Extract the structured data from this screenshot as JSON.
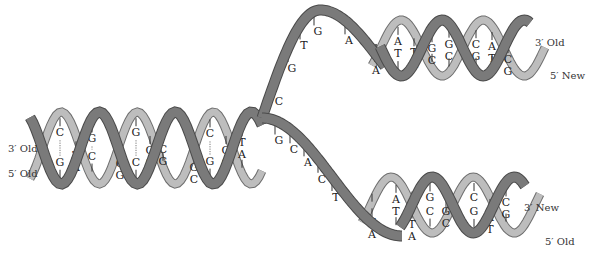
{
  "labels": {
    "left_top": "3′ Old",
    "left_bottom": "5′ Old",
    "upper_right_top": "3′ Old",
    "upper_right_bottom": "5′ New",
    "lower_right_top": "3′ New",
    "lower_right_bottom": "5′ Old"
  },
  "parent_helix": {
    "pairs": [
      {
        "top": "C",
        "bottom": "G"
      },
      {
        "top": "T",
        "bottom": "A"
      },
      {
        "top": "G",
        "bottom": "C"
      },
      {
        "top": "C",
        "bottom": "G"
      },
      {
        "top": "G",
        "bottom": "C"
      },
      {
        "top": "G",
        "bottom": "C"
      },
      {
        "top": "C",
        "bottom": "G"
      },
      {
        "top": "G",
        "bottom": "C"
      },
      {
        "top": "C",
        "bottom": "G"
      },
      {
        "top": "G",
        "bottom": "C"
      },
      {
        "top": "T",
        "bottom": "A"
      }
    ]
  },
  "upper_single_strand": [
    "C",
    "G",
    "T",
    "G",
    "A"
  ],
  "lower_single_strand": [
    "G",
    "C",
    "A",
    "C",
    "T"
  ],
  "upper_daughter": {
    "pairs": [
      {
        "top": "T",
        "bottom": "A"
      },
      {
        "top": "A",
        "bottom": "T"
      },
      {
        "top": "T",
        "bottom": "A"
      },
      {
        "top": "G",
        "bottom": "C"
      },
      {
        "top": "G",
        "bottom": "C"
      },
      {
        "top": "C",
        "bottom": "G"
      },
      {
        "top": "A",
        "bottom": "T"
      },
      {
        "top": "C",
        "bottom": "G"
      }
    ]
  },
  "lower_daughter": {
    "pairs": [
      {
        "top": "T",
        "bottom": "A"
      },
      {
        "top": "A",
        "bottom": "T"
      },
      {
        "top": "T",
        "bottom": "A"
      },
      {
        "top": "G",
        "bottom": "C"
      },
      {
        "top": "G",
        "bottom": "C"
      },
      {
        "top": "C",
        "bottom": "G"
      },
      {
        "top": "A",
        "bottom": "T"
      },
      {
        "top": "C",
        "bottom": "G"
      }
    ]
  },
  "colors": {
    "dark_strand": "#7a7a7a",
    "light_strand": "#bdbdbd"
  }
}
